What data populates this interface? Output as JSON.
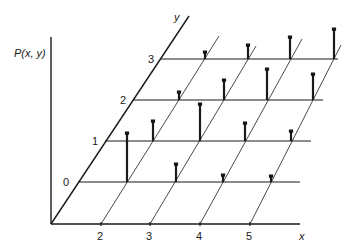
{
  "figure": {
    "vertical_axis_label": "P(x, y)",
    "x_axis_label": "x",
    "y_axis_label": "y",
    "x_ticks": [
      "2",
      "3",
      "4",
      "5"
    ],
    "y_ticks": [
      "0",
      "1",
      "2",
      "3"
    ]
  },
  "geometry": {
    "origin": [
      51,
      224
    ],
    "vertical_axis_top": [
      51,
      37
    ],
    "y_axis_end": [
      189,
      16
    ],
    "x_axis_end": 300,
    "x_tick_px": [
      101,
      150,
      200,
      250
    ],
    "rows": [
      {
        "y": 182,
        "x_start": 78,
        "x_end": 300
      },
      {
        "y": 141,
        "x_start": 105,
        "x_end": 311
      },
      {
        "y": 100,
        "x_start": 133,
        "x_end": 323
      },
      {
        "y": 59,
        "x_start": 161,
        "x_end": 338
      }
    ],
    "diagonal_tops": [
      [
        219,
        36
      ],
      [
        256,
        46
      ],
      [
        302,
        39
      ],
      [
        341,
        45
      ]
    ],
    "spikes": [
      {
        "row": 0,
        "x": 127,
        "top": 133
      },
      {
        "row": 0,
        "x": 176,
        "top": 164
      },
      {
        "row": 0,
        "x": 223,
        "top": 175
      },
      {
        "row": 0,
        "x": 271,
        "top": 176
      },
      {
        "row": 1,
        "x": 153,
        "top": 121
      },
      {
        "row": 1,
        "x": 200,
        "top": 104
      },
      {
        "row": 1,
        "x": 245,
        "top": 123
      },
      {
        "row": 1,
        "x": 291,
        "top": 131
      },
      {
        "row": 2,
        "x": 179,
        "top": 92
      },
      {
        "row": 2,
        "x": 224,
        "top": 80
      },
      {
        "row": 2,
        "x": 267,
        "top": 69
      },
      {
        "row": 2,
        "x": 313,
        "top": 74
      },
      {
        "row": 3,
        "x": 205,
        "top": 52
      },
      {
        "row": 3,
        "x": 248,
        "top": 45
      },
      {
        "row": 3,
        "x": 290,
        "top": 37
      },
      {
        "row": 3,
        "x": 334,
        "top": 29
      }
    ]
  },
  "colors": {
    "line": "#1a1a1a",
    "background": "#ffffff"
  }
}
